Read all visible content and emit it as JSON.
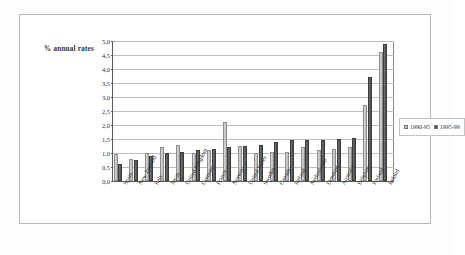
{
  "chart_data": {
    "type": "bar",
    "title": "",
    "axis_caption": "% annual rates",
    "xlabel": "",
    "ylabel": "% annual rates",
    "ylim": [
      0.0,
      5.0
    ],
    "ytick_step": 0.5,
    "ytick_labels": [
      "5,0",
      "4,5",
      "4,0",
      "3,5",
      "3,0",
      "2,5",
      "2,0",
      "1,5",
      "1,0",
      "0,5",
      "0,0"
    ],
    "ytick_values": [
      5.0,
      4.5,
      4.0,
      3.5,
      3.0,
      2.5,
      2.0,
      1.5,
      1.0,
      0.5,
      0.0
    ],
    "grid": true,
    "legend_position": "right",
    "categories": [
      "Spain",
      "New Zealand",
      "Italy",
      "Japan",
      "United Kingdom",
      "Germany",
      "France",
      "Norway",
      "United States",
      "Sweden",
      "Canada",
      "Iceland",
      "Netherlands",
      "Denmark",
      "Australia",
      "Belgium",
      "Finland",
      "Ireland"
    ],
    "series": [
      {
        "name": "1990-95",
        "color": "#c9c9c9",
        "values": [
          0.95,
          0.8,
          1.0,
          1.2,
          1.3,
          1.0,
          1.1,
          2.1,
          1.25,
          1.0,
          1.05,
          1.05,
          1.2,
          1.1,
          1.15,
          1.2,
          2.7,
          4.6
        ]
      },
      {
        "name": "1995-99",
        "color": "#565656",
        "values": [
          0.6,
          0.75,
          0.9,
          1.0,
          1.05,
          1.1,
          1.15,
          1.2,
          1.25,
          1.3,
          1.4,
          1.45,
          1.45,
          1.45,
          1.5,
          1.55,
          3.7,
          4.9
        ]
      }
    ]
  },
  "legend": {
    "items": [
      {
        "label": "1990-95",
        "color": "#c9c9c9"
      },
      {
        "label": "1995-99",
        "color": "#565656"
      }
    ]
  }
}
